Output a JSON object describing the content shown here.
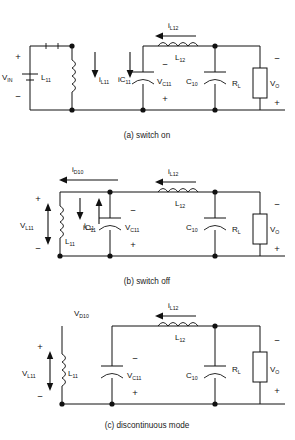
{
  "figure": {
    "panels": [
      {
        "id": "a",
        "caption": "(a) switch on",
        "components": [
          {
            "name": "V_IN",
            "base": "V",
            "sub": "IN",
            "type": "voltage-source"
          },
          {
            "name": "L11",
            "base": "L",
            "sub": "11",
            "type": "inductor"
          },
          {
            "name": "C11",
            "base": "C",
            "sub": "11",
            "type": "capacitor"
          },
          {
            "name": "L12",
            "base": "L",
            "sub": "12",
            "type": "inductor"
          },
          {
            "name": "C10",
            "base": "C",
            "sub": "10",
            "type": "capacitor"
          },
          {
            "name": "RL",
            "base": "R",
            "sub": "L",
            "type": "resistor"
          }
        ],
        "currents": [
          {
            "base": "i",
            "sub": "L11",
            "direction": "down"
          },
          {
            "base": "iC",
            "sub": "11",
            "direction": "down"
          },
          {
            "base": "i",
            "sub": "L12",
            "direction": "left"
          }
        ],
        "voltages": [
          {
            "base": "V",
            "sub": "C11",
            "plus": "bottom",
            "minus": "top"
          },
          {
            "base": "V",
            "sub": "O",
            "plus": "bottom",
            "minus": "top"
          }
        ],
        "switch_state": "closed"
      },
      {
        "id": "b",
        "caption": "(b) switch off",
        "components": [
          {
            "name": "L11",
            "base": "L",
            "sub": "11",
            "type": "inductor"
          },
          {
            "name": "C11",
            "base": "C",
            "sub": "11",
            "type": "capacitor"
          },
          {
            "name": "L12",
            "base": "L",
            "sub": "12",
            "type": "inductor"
          },
          {
            "name": "C10",
            "base": "C",
            "sub": "10",
            "type": "capacitor"
          },
          {
            "name": "RL",
            "base": "R",
            "sub": "L",
            "type": "resistor"
          }
        ],
        "currents": [
          {
            "base": "i",
            "sub": "D10",
            "direction": "left"
          },
          {
            "base": "i",
            "sub": "L11",
            "direction": "down"
          },
          {
            "base": "iC",
            "sub": "11",
            "direction": "up"
          },
          {
            "base": "i",
            "sub": "L12",
            "direction": "left"
          }
        ],
        "voltages": [
          {
            "base": "V",
            "sub": "L11",
            "plus": "top",
            "minus": "bottom"
          },
          {
            "base": "V",
            "sub": "C11",
            "plus": "bottom",
            "minus": "top"
          },
          {
            "base": "V",
            "sub": "O",
            "plus": "bottom",
            "minus": "top"
          }
        ],
        "switch_state": "open"
      },
      {
        "id": "c",
        "caption": "(c) discontinuous mode",
        "components": [
          {
            "name": "L11",
            "base": "L",
            "sub": "11",
            "type": "inductor"
          },
          {
            "name": "C11",
            "base": "C",
            "sub": "11",
            "type": "capacitor"
          },
          {
            "name": "L12",
            "base": "L",
            "sub": "12",
            "type": "inductor"
          },
          {
            "name": "C10",
            "base": "C",
            "sub": "10",
            "type": "capacitor"
          },
          {
            "name": "RL",
            "base": "R",
            "sub": "L",
            "type": "resistor"
          }
        ],
        "currents": [
          {
            "base": "i",
            "sub": "L12",
            "direction": "left"
          }
        ],
        "voltages": [
          {
            "base": "V",
            "sub": "D10",
            "plus": "",
            "minus": ""
          },
          {
            "base": "V",
            "sub": "L11",
            "plus": "top",
            "minus": "bottom"
          },
          {
            "base": "V",
            "sub": "C11",
            "plus": "bottom",
            "minus": "top"
          },
          {
            "base": "V",
            "sub": "O",
            "plus": "bottom",
            "minus": "top"
          }
        ],
        "open_circuit": true
      }
    ],
    "symbols": {
      "plus": "+",
      "minus": "−"
    },
    "colors": {
      "line": "#111111",
      "background": "#ffffff",
      "text": "#111111"
    }
  }
}
